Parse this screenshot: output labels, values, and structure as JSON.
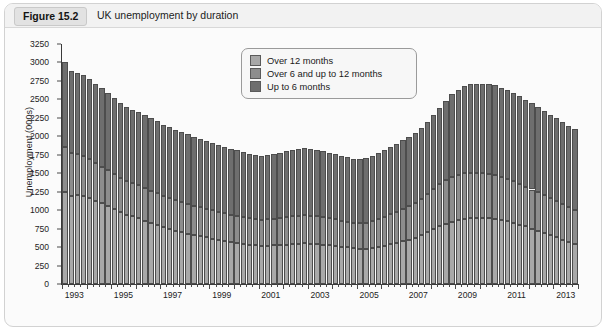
{
  "figure": {
    "tag": "Figure 15.2",
    "title": "UK unemployment by duration"
  },
  "chart_data": {
    "type": "bar",
    "stacked": true,
    "title": "UK unemployment by duration",
    "xlabel": "",
    "ylabel": "Unemployment (000s)",
    "ylim": [
      0,
      3250
    ],
    "ytick_step": 250,
    "yticks": [
      0,
      250,
      500,
      750,
      1000,
      1250,
      1500,
      1750,
      2000,
      2250,
      2500,
      2750,
      3000,
      3250
    ],
    "ytick_labels": [
      "0",
      "250",
      "500",
      "750",
      "1000",
      "1250",
      "1500",
      "1750",
      "2000",
      "2250",
      "2500",
      "2750",
      "3000",
      "3250"
    ],
    "grid": false,
    "legend_position": "top-center",
    "x_tick_labels": [
      "1993",
      "1995",
      "1997",
      "1999",
      "2001",
      "2003",
      "2005",
      "2007",
      "2009",
      "2011",
      "2013"
    ],
    "x_start_year": 1993,
    "x_end_year": 2013,
    "x_period": "quarterly",
    "n_periods": 84,
    "series": [
      {
        "name": "Up to 6 months",
        "color": "#6e6e6e",
        "values": [
          1150,
          1120,
          1100,
          1090,
          1080,
          1070,
          1060,
          1050,
          1030,
          1010,
          1000,
          995,
          990,
          985,
          980,
          975,
          965,
          955,
          950,
          945,
          940,
          930,
          925,
          920,
          915,
          905,
          900,
          895,
          890,
          880,
          875,
          870,
          870,
          875,
          880,
          885,
          890,
          895,
          900,
          905,
          900,
          895,
          890,
          885,
          880,
          875,
          870,
          865,
          865,
          870,
          880,
          890,
          900,
          910,
          920,
          930,
          940,
          950,
          960,
          975,
          1000,
          1040,
          1080,
          1120,
          1150,
          1175,
          1195,
          1205,
          1210,
          1215,
          1220,
          1215,
          1205,
          1195,
          1185,
          1175,
          1165,
          1155,
          1145,
          1135,
          1125,
          1115,
          1105,
          1095
        ]
      },
      {
        "name": "Over 6 and up to 12 months",
        "color": "#8d8d8d",
        "values": [
          600,
          580,
          560,
          545,
          530,
          510,
          495,
          480,
          470,
          460,
          455,
          450,
          445,
          440,
          435,
          430,
          425,
          420,
          415,
          410,
          405,
          400,
          395,
          390,
          385,
          380,
          375,
          370,
          365,
          360,
          355,
          350,
          350,
          355,
          360,
          365,
          370,
          375,
          380,
          385,
          380,
          375,
          370,
          365,
          360,
          355,
          350,
          345,
          345,
          350,
          360,
          375,
          390,
          405,
          420,
          435,
          450,
          470,
          495,
          520,
          545,
          570,
          590,
          605,
          615,
          620,
          620,
          615,
          610,
          600,
          590,
          580,
          570,
          560,
          550,
          540,
          530,
          520,
          510,
          500,
          490,
          480,
          470,
          460
        ]
      },
      {
        "name": "Over 12 months",
        "color": "#a8a8a8",
        "values": [
          1250,
          1190,
          1200,
          1195,
          1160,
          1130,
          1095,
          1060,
          1020,
          975,
          940,
          915,
          890,
          860,
          830,
          800,
          770,
          745,
          720,
          700,
          680,
          660,
          645,
          630,
          615,
          600,
          585,
          570,
          560,
          545,
          535,
          525,
          520,
          520,
          525,
          530,
          535,
          540,
          545,
          550,
          545,
          540,
          535,
          525,
          515,
          505,
          495,
          485,
          480,
          480,
          490,
          505,
          520,
          540,
          560,
          580,
          600,
          625,
          660,
          700,
          740,
          780,
          815,
          845,
          865,
          880,
          890,
          895,
          895,
          890,
          880,
          865,
          850,
          830,
          805,
          780,
          750,
          720,
          690,
          660,
          630,
          600,
          570,
          545
        ]
      }
    ]
  },
  "legend": {
    "items": [
      {
        "label": "Over 12 months",
        "color": "#a8a8a8"
      },
      {
        "label": "Over 6 and up to 12 months",
        "color": "#8d8d8d"
      },
      {
        "label": "Up to 6 months",
        "color": "#6e6e6e"
      }
    ]
  }
}
